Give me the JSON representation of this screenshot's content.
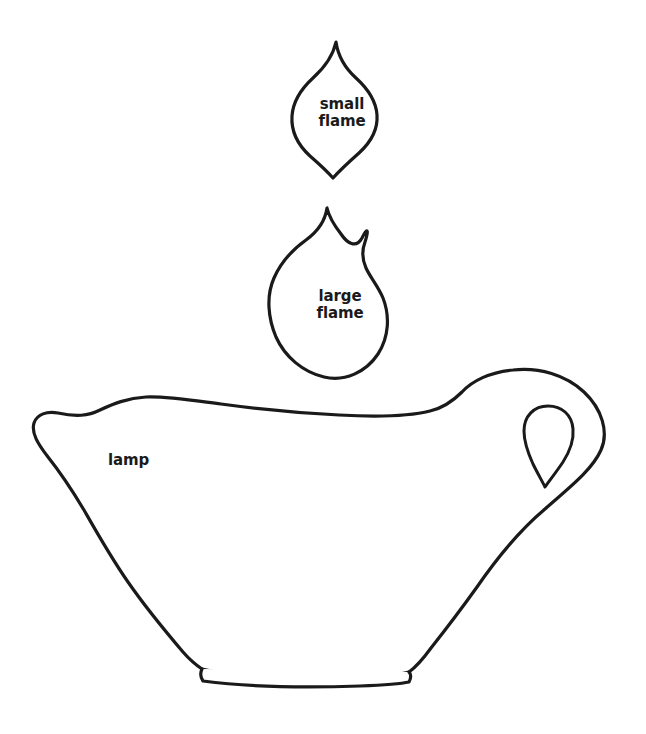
{
  "page": {
    "background_color": "#ffffff",
    "outline_color": "#1a1a1a",
    "text_color": "#1a1a1a",
    "width": 646,
    "height": 734
  },
  "pieces": [
    {
      "id": "small-flame",
      "label": "small\nflame",
      "label_line1": "small",
      "label_line2": "flame",
      "shape": "flame",
      "description": "small pointed flame outline",
      "bounds": {
        "x": 290,
        "y": 40,
        "width": 90,
        "height": 140
      }
    },
    {
      "id": "large-flame",
      "label": "large\nflame",
      "label_line1": "large",
      "label_line2": "flame",
      "shape": "flame",
      "description": "large pointed flame outline",
      "bounds": {
        "x": 268,
        "y": 206,
        "width": 122,
        "height": 175
      }
    },
    {
      "id": "lamp",
      "label": "lamp",
      "shape": "oil-lamp",
      "description": "oil lamp body with spout, foot and teardrop handle opening",
      "bounds": {
        "x": 32,
        "y": 370,
        "width": 575,
        "height": 315
      }
    }
  ]
}
